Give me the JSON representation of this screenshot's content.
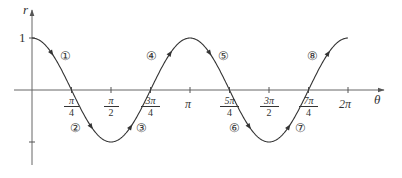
{
  "chart_data": {
    "type": "line",
    "title": "",
    "function": "r = cos(2θ)",
    "xlabel": "θ",
    "ylabel": "r",
    "xlim": [
      0,
      6.2832
    ],
    "ylim": [
      -1,
      1
    ],
    "grid": false,
    "legend": null,
    "x_ticks": [
      {
        "value": 0.7854,
        "label_num": "π",
        "label_den": "4"
      },
      {
        "value": 1.5708,
        "label_num": "π",
        "label_den": "2"
      },
      {
        "value": 2.3562,
        "label_num": "3π",
        "label_den": "4"
      },
      {
        "value": 3.1416,
        "label": "π"
      },
      {
        "value": 3.927,
        "label_num": "5π",
        "label_den": "4"
      },
      {
        "value": 4.7124,
        "label_num": "3π",
        "label_den": "2"
      },
      {
        "value": 5.4978,
        "label_num": "7π",
        "label_den": "4"
      },
      {
        "value": 6.2832,
        "label": "2π"
      }
    ],
    "y_ticks": [
      {
        "value": 1,
        "label": "1"
      },
      {
        "value": -1,
        "label": ""
      }
    ],
    "series": [
      {
        "name": "cos 2θ",
        "x": [
          0,
          0.3927,
          0.7854,
          1.1781,
          1.5708,
          1.9635,
          2.3562,
          2.7489,
          3.1416,
          3.5343,
          3.927,
          4.3197,
          4.7124,
          5.1051,
          5.4978,
          5.8905,
          6.2832
        ],
        "values": [
          1,
          0.707,
          0,
          -0.707,
          -1,
          -0.707,
          0,
          0.707,
          1,
          0.707,
          0,
          -0.707,
          -1,
          -0.707,
          0,
          0.707,
          1
        ]
      }
    ],
    "annotations": [
      {
        "label": "①",
        "segment": 1,
        "theta_range": "0 to π/4"
      },
      {
        "label": "②",
        "segment": 2,
        "theta_range": "π/4 to π/2"
      },
      {
        "label": "③",
        "segment": 3,
        "theta_range": "π/2 to 3π/4"
      },
      {
        "label": "④",
        "segment": 4,
        "theta_range": "3π/4 to π"
      },
      {
        "label": "⑤",
        "segment": 5,
        "theta_range": "π to 5π/4"
      },
      {
        "label": "⑥",
        "segment": 6,
        "theta_range": "5π/4 to 3π/2"
      },
      {
        "label": "⑦",
        "segment": 7,
        "theta_range": "3π/2 to 7π/4"
      },
      {
        "label": "⑧",
        "segment": 8,
        "theta_range": "7π/4 to 2π"
      }
    ],
    "direction_arrows": true
  },
  "axes": {
    "x_label": "θ",
    "y_label": "r",
    "y_tick_one": "1"
  },
  "ticks": {
    "pi4": {
      "num": "π",
      "den": "4"
    },
    "pi2": {
      "num": "π",
      "den": "2"
    },
    "pi34": {
      "num": "3π",
      "den": "4"
    },
    "pi": "π",
    "pi54": {
      "num": "5π",
      "den": "4"
    },
    "pi32": {
      "num": "3π",
      "den": "2"
    },
    "pi74": {
      "num": "7π",
      "den": "4"
    },
    "pi2x": "2π"
  },
  "segments": [
    "①",
    "②",
    "③",
    "④",
    "⑤",
    "⑥",
    "⑦",
    "⑧"
  ],
  "colors": {
    "axis": "#555555",
    "curve": "#333333",
    "text": "#333333"
  }
}
